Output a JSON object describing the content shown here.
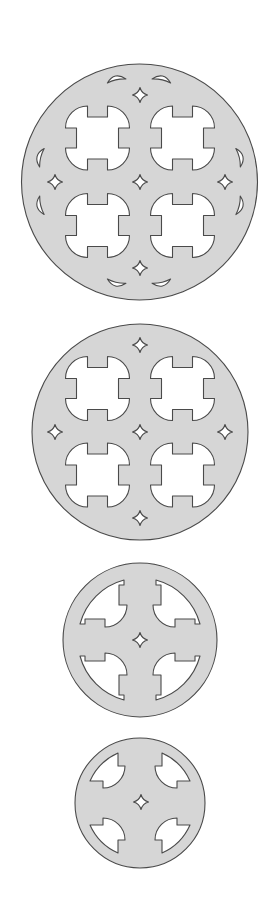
{
  "canvas": {
    "width": 272,
    "height": 902,
    "background": "#ffffff"
  },
  "colors": {
    "fill": "#d6d6d6",
    "stroke": "#4a4a4a",
    "cutout": "#ffffff"
  },
  "patterns": [
    {
      "name": "disc-1-four-windows-lenses",
      "center": [
        139.5,
        182
      ],
      "radius": 118,
      "windows": [
        [
          97.5,
          138
        ],
        [
          182.5,
          138
        ],
        [
          97.5,
          225.5
        ],
        [
          182.5,
          225.5
        ]
      ],
      "stars": [
        [
          140,
          95
        ],
        [
          55,
          182
        ],
        [
          140,
          182
        ],
        [
          225,
          182
        ],
        [
          140,
          268
        ]
      ],
      "lenses": [
        {
          "at": [
            116,
            78
          ],
          "rot": -12.5
        },
        {
          "at": [
            162,
            78
          ],
          "rot": 12.5
        },
        {
          "at": [
            39,
            157
          ],
          "rot": -76
        },
        {
          "at": [
            39,
            206
          ],
          "rot": -103.5
        },
        {
          "at": [
            241,
            157
          ],
          "rot": 76.2
        },
        {
          "at": [
            241,
            206
          ],
          "rot": 103.2
        },
        {
          "at": [
            116,
            284
          ],
          "rot": 192.8
        },
        {
          "at": [
            162,
            284
          ],
          "rot": 167.2
        }
      ]
    },
    {
      "name": "disc-2-four-windows",
      "center": [
        140,
        432
      ],
      "radius": 108,
      "windows": [
        [
          97.5,
          388.5
        ],
        [
          182.5,
          388.5
        ],
        [
          97.5,
          475
        ],
        [
          182.5,
          475
        ]
      ],
      "stars": [
        [
          140,
          345
        ],
        [
          55,
          432
        ],
        [
          140,
          432
        ],
        [
          225,
          432
        ],
        [
          140,
          518
        ]
      ]
    },
    {
      "name": "disc-3-ringed-cross",
      "center": [
        140,
        640
      ],
      "radius": 77,
      "quadrant_style": "ring",
      "stars": [
        [
          140,
          640
        ]
      ]
    },
    {
      "name": "disc-4-cross",
      "center": [
        140,
        803
      ],
      "radius": 65,
      "quadrant_style": "plain",
      "stars": [
        [
          141,
          802
        ]
      ]
    }
  ]
}
